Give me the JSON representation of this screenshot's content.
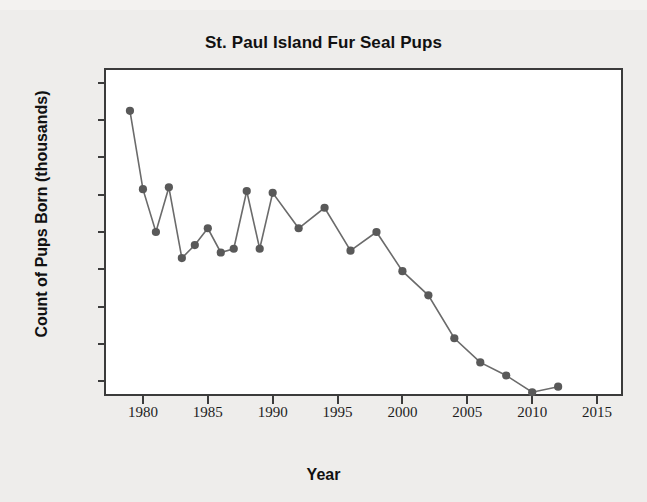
{
  "chart_data": {
    "type": "line",
    "title": "St. Paul Island Fur Seal Pups",
    "xlabel": "Year",
    "ylabel": "Count of Pups Born (thousands)",
    "xlim": [
      1977,
      2017
    ],
    "ylim": [
      92,
      268
    ],
    "xticks": [
      1980,
      1985,
      1990,
      1995,
      2000,
      2005,
      2010,
      2015
    ],
    "xtick_labels": [
      "1980",
      "1985",
      "1990",
      "1995",
      "2000",
      "2005",
      "2010",
      "2015"
    ],
    "yticks": [
      100,
      120,
      140,
      160,
      180,
      200,
      220,
      240,
      260
    ],
    "ytick_labels": [
      "100",
      "120",
      "140",
      "160",
      "180",
      "200",
      "220",
      "240",
      "260"
    ],
    "grid": false,
    "legend": "none",
    "marker": "filled-circle",
    "series_color": "#595959",
    "line_color": "#6b6b6b",
    "x": [
      1979,
      1980,
      1981,
      1982,
      1983,
      1984,
      1985,
      1986,
      1987,
      1988,
      1989,
      1990,
      1992,
      1994,
      1996,
      1998,
      2000,
      2002,
      2004,
      2006,
      2008,
      2010,
      2012
    ],
    "values": [
      245,
      203,
      180,
      204,
      166,
      173,
      182,
      169,
      171,
      202,
      171,
      201,
      182,
      193,
      170,
      180,
      159,
      146,
      123,
      110,
      103,
      94,
      97
    ],
    "series": [
      {
        "name": "Count of Pups Born (thousands)",
        "points": [
          {
            "year": 1979,
            "count": 245
          },
          {
            "year": 1980,
            "count": 203
          },
          {
            "year": 1981,
            "count": 180
          },
          {
            "year": 1982,
            "count": 204
          },
          {
            "year": 1983,
            "count": 166
          },
          {
            "year": 1984,
            "count": 173
          },
          {
            "year": 1985,
            "count": 182
          },
          {
            "year": 1986,
            "count": 169
          },
          {
            "year": 1987,
            "count": 171
          },
          {
            "year": 1988,
            "count": 202
          },
          {
            "year": 1989,
            "count": 171
          },
          {
            "year": 1990,
            "count": 201
          },
          {
            "year": 1992,
            "count": 182
          },
          {
            "year": 1994,
            "count": 193
          },
          {
            "year": 1996,
            "count": 170
          },
          {
            "year": 1998,
            "count": 180
          },
          {
            "year": 2000,
            "count": 159
          },
          {
            "year": 2002,
            "count": 146
          },
          {
            "year": 2004,
            "count": 123
          },
          {
            "year": 2006,
            "count": 110
          },
          {
            "year": 2008,
            "count": 103
          },
          {
            "year": 2010,
            "count": 94
          },
          {
            "year": 2012,
            "count": 97
          }
        ]
      }
    ]
  }
}
